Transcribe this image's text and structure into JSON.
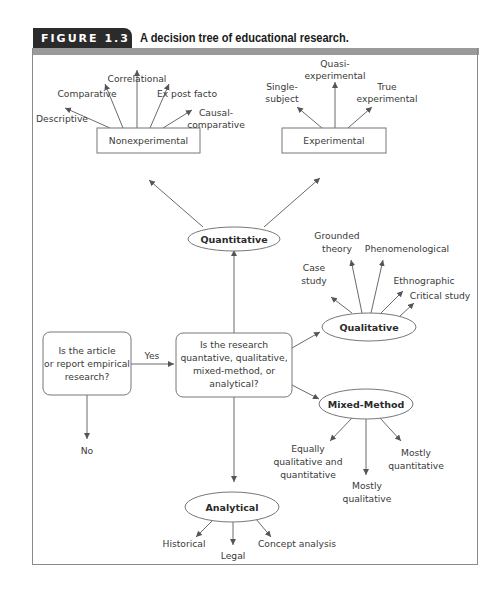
{
  "figure": {
    "label": "FIGURE 1.3",
    "caption": "A decision tree of educational research."
  },
  "nodes": {
    "empirical_question": {
      "lines": [
        "Is the article",
        "or report empirical",
        "research?"
      ]
    },
    "research_question": {
      "lines": [
        "Is the research",
        "quantative, qualitative,",
        "mixed-method, or",
        "analytical?"
      ]
    },
    "yes_label": "Yes",
    "no_label": "No",
    "quantitative": "Quantitative",
    "qualitative": "Qualitative",
    "mixed_method": "Mixed-Method",
    "analytical": "Analytical",
    "nonexperimental": "Nonexperimental",
    "experimental": "Experimental"
  },
  "leaves": {
    "nonexperimental": {
      "descriptive": "Descriptive",
      "comparative": "Comparative",
      "correlational": "Correlational",
      "ex_post_facto": "Ex post facto",
      "causal_comparative": [
        "Causal-",
        "comparative"
      ]
    },
    "experimental": {
      "single_subject": [
        "Single-",
        "subject"
      ],
      "quasi_experimental": [
        "Quasi-",
        "experimental"
      ],
      "true_experimental": [
        "True",
        "experimental"
      ]
    },
    "qualitative": {
      "case_study": [
        "Case",
        "study"
      ],
      "grounded_theory": [
        "Grounded",
        "theory"
      ],
      "phenomenological": "Phenomenological",
      "ethnographic": "Ethnographic",
      "critical_study": "Critical study"
    },
    "mixed_method": {
      "equally": [
        "Equally",
        "qualitative and",
        "quantitative"
      ],
      "mostly_qualitative": [
        "Mostly",
        "qualitative"
      ],
      "mostly_quantitative": [
        "Mostly",
        "quantitative"
      ]
    },
    "analytical": {
      "historical": "Historical",
      "legal": "Legal",
      "concept_analysis": "Concept analysis"
    }
  },
  "colors": {
    "header_tab": "#2b2b2b",
    "header_band": "#9a9a9a",
    "stroke": "#777777",
    "text": "#3a3a3a"
  }
}
